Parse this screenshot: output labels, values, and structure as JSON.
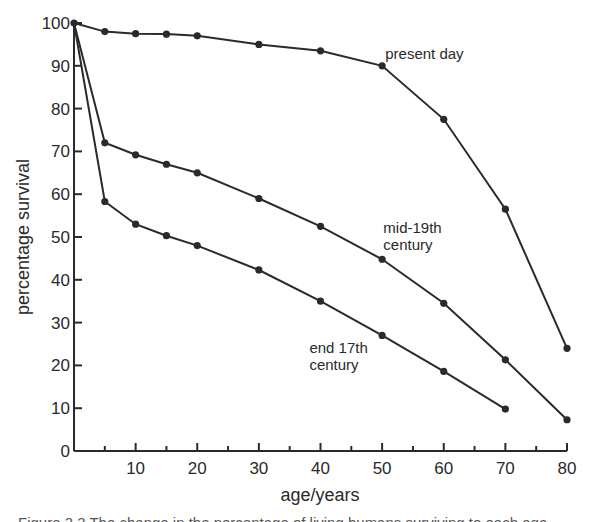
{
  "chart_data": {
    "type": "line",
    "title": "",
    "xlabel": "age/years",
    "ylabel": "percentage survival",
    "xlim": [
      0,
      80
    ],
    "ylim": [
      0,
      100
    ],
    "grid": false,
    "legend": "inline annotations",
    "x_ticks": [
      0,
      10,
      20,
      30,
      40,
      50,
      60,
      70,
      80
    ],
    "x_tick_labels": [
      "10",
      "20",
      "30",
      "40",
      "50",
      "60",
      "70",
      "80"
    ],
    "y_ticks": [
      0,
      10,
      20,
      30,
      40,
      50,
      60,
      70,
      80,
      90,
      100
    ],
    "y_tick_labels": [
      "0",
      "10",
      "20",
      "30",
      "40",
      "50",
      "60",
      "70",
      "80",
      "90",
      "100"
    ],
    "series": [
      {
        "name": "present day",
        "x": [
          0,
          5,
          10,
          15,
          20,
          30,
          40,
          50,
          60,
          70,
          80
        ],
        "values": [
          100,
          98,
          97.5,
          97.4,
          97,
          95,
          93.5,
          90,
          77.5,
          56.5,
          24
        ]
      },
      {
        "name": "mid-19th century",
        "x": [
          0,
          5,
          10,
          15,
          20,
          30,
          40,
          50,
          60,
          70,
          80
        ],
        "values": [
          100,
          72,
          69.2,
          67,
          65,
          59,
          52.5,
          44.8,
          34.5,
          21.3,
          7.3
        ]
      },
      {
        "name": "end 17th century",
        "x": [
          0,
          5,
          10,
          15,
          20,
          30,
          40,
          50,
          60,
          70
        ],
        "values": [
          100,
          58.3,
          53,
          50.3,
          48,
          42.3,
          35,
          27,
          18.6,
          9.8
        ]
      }
    ],
    "annotations": [
      {
        "lines": [
          "present day"
        ],
        "x": 50.5,
        "y": 91.5
      },
      {
        "lines": [
          "mid-19th",
          "century"
        ],
        "x": 50.2,
        "y": 51
      },
      {
        "lines": [
          "end 17th",
          "century"
        ],
        "x": 38.2,
        "y": 23
      }
    ]
  },
  "caption": {
    "text": "Figure 3.3 The change in the percentage of living humans surviving to each age"
  }
}
